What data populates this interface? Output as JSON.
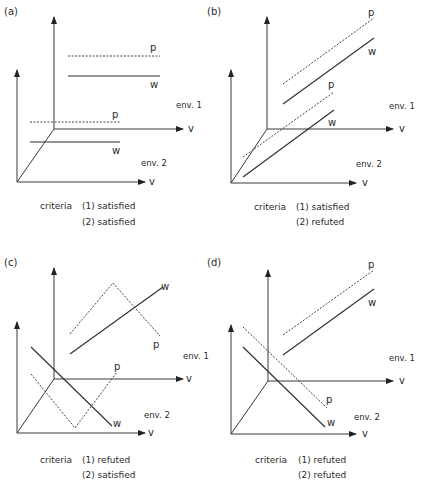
{
  "figure": {
    "colors": {
      "ink": "#2e2e2e",
      "background": "#ffffff"
    },
    "panels": [
      {
        "id": "a",
        "label": "(a)",
        "criteria_label": "criteria",
        "criteria": [
          "(1) satisfied",
          "(2) satisfied"
        ],
        "axis_label": "v",
        "env1_label": "env. 1",
        "env2_label": "env. 2",
        "p_label": "p",
        "w_label": "w"
      },
      {
        "id": "b",
        "label": "(b)",
        "criteria_label": "criteria",
        "criteria": [
          "(1) satisfied",
          "(2) refuted"
        ],
        "axis_label": "v",
        "env1_label": "env. 1",
        "env2_label": "env. 2",
        "p_label": "p",
        "w_label": "w"
      },
      {
        "id": "c",
        "label": "(c)",
        "criteria_label": "criteria",
        "criteria": [
          "(1) refuted",
          "(2) satisfied"
        ],
        "axis_label": "v",
        "env1_label": "env. 1",
        "env2_label": "env. 2",
        "p_label": "p",
        "w_label": "w"
      },
      {
        "id": "d",
        "label": "(d)",
        "criteria_label": "criteria",
        "criteria": [
          "(1) refuted",
          "(2) refuted"
        ],
        "axis_label": "v",
        "env1_label": "env. 1",
        "env2_label": "env. 2",
        "p_label": "p",
        "w_label": "w"
      }
    ]
  }
}
